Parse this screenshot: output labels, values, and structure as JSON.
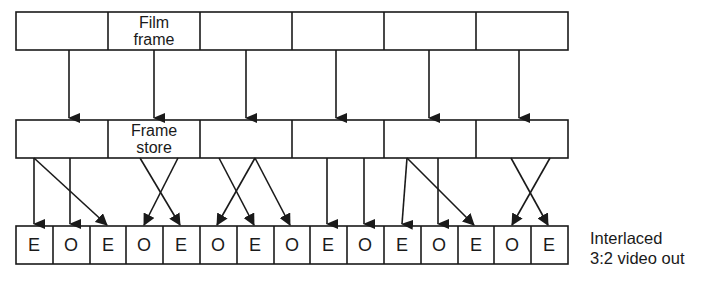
{
  "diagram": {
    "rows": {
      "film": {
        "label_line1": "Film",
        "label_line2": "frame",
        "count": 6
      },
      "store": {
        "label_line1": "Frame",
        "label_line2": "store",
        "count": 6
      },
      "video": {
        "fields": [
          "E",
          "O",
          "E",
          "O",
          "E",
          "O",
          "E",
          "O",
          "E",
          "O",
          "E",
          "O",
          "E",
          "O",
          "E"
        ]
      }
    },
    "output_label_line1": "Interlaced",
    "output_label_line2": "3:2 video out",
    "mapping": [
      {
        "frame": 1,
        "fields": [
          0,
          1,
          2
        ]
      },
      {
        "frame": 2,
        "fields": [
          3,
          4
        ]
      },
      {
        "frame": 3,
        "fields": [
          5,
          6,
          7
        ]
      },
      {
        "frame": 4,
        "fields": [
          8,
          9
        ]
      },
      {
        "frame": 5,
        "fields": [
          10,
          11,
          12
        ]
      },
      {
        "frame": 6,
        "fields": [
          13,
          14
        ]
      }
    ],
    "line_color": "#1a1a1a"
  }
}
